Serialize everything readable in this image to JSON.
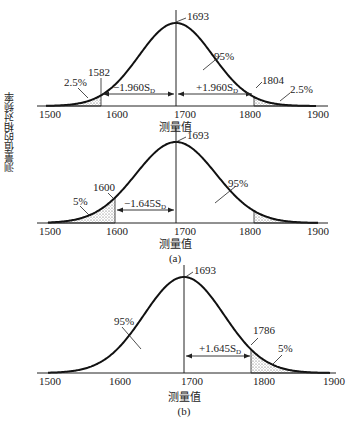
{
  "ylabel": "测量值的相对频率",
  "chart_data": [
    {
      "type": "area",
      "title": "",
      "xlabel": "测量值",
      "ylabel": "测量值的相对频率",
      "xlim": [
        1500,
        1900
      ],
      "xticks": [
        "1500",
        "1600",
        "1700",
        "1800",
        "1900"
      ],
      "distribution": "normal",
      "mean": 1693,
      "shaded_regions": [
        [
          1500,
          1582
        ],
        [
          1804,
          1900
        ]
      ],
      "annotations": [
        "1693",
        "1582",
        "1804",
        "2.5%",
        "2.5%",
        "95%",
        "-1.960S_D",
        "+1.960S_D"
      ]
    },
    {
      "type": "area",
      "title": "",
      "caption": "(a)",
      "xlabel": "测量值",
      "xlim": [
        1500,
        1900
      ],
      "xticks": [
        "1500",
        "1600",
        "1700",
        "1800",
        "1900"
      ],
      "distribution": "normal",
      "mean": 1693,
      "shaded_regions": [
        [
          1500,
          1600
        ],
        [
          1804,
          1900
        ]
      ],
      "annotations": [
        "1693",
        "1600",
        "5%",
        "95%",
        "-1.645S_D"
      ]
    },
    {
      "type": "area",
      "title": "",
      "caption": "(b)",
      "xlabel": "测量值",
      "xlim": [
        1500,
        1900
      ],
      "xticks": [
        "1500",
        "1600",
        "1700",
        "1800",
        "1900"
      ],
      "distribution": "normal",
      "mean": 1693,
      "shaded_regions": [
        [
          1786,
          1900
        ]
      ],
      "annotations": [
        "1693",
        "1786",
        "5%",
        "95%",
        "+1.645S_D"
      ]
    }
  ],
  "c1": {
    "mean": "1693",
    "left": "1582",
    "right": "1804",
    "lp": "2.5%",
    "rp": "2.5%",
    "mid": "95%",
    "ls": "−1.960S",
    "rs": "+1.960S",
    "sub": "D",
    "xlabel": "测量值"
  },
  "c2": {
    "mean": "1693",
    "left": "1600",
    "lp": "5%",
    "mid": "95%",
    "ls": "−1.645S",
    "sub": "D",
    "xlabel": "测量值",
    "caption": "(a)"
  },
  "c3": {
    "mean": "1693",
    "right": "1786",
    "rp": "5%",
    "mid": "95%",
    "rs": "+1.645S",
    "sub": "D",
    "xlabel": "测量值",
    "caption": "(b)"
  },
  "ticks": [
    "1500",
    "1600",
    "1700",
    "1800",
    "1900"
  ]
}
